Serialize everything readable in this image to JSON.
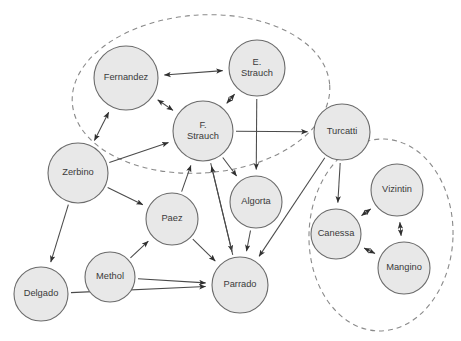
{
  "diagram": {
    "type": "directed-graph",
    "background_color": "#ffffff",
    "node_fill_color": "#e8e8e8",
    "node_stroke_color": "#6b6b6b",
    "edge_color": "#4a4a4a",
    "cluster_stroke_color": "#8a8a8a",
    "canvas": {
      "width": 461,
      "height": 341
    }
  },
  "nodes": [
    {
      "id": "fernandez",
      "label": "Fernandez",
      "lines": [
        "Fernandez"
      ],
      "cx": 126,
      "cy": 78,
      "r": 32
    },
    {
      "id": "e_strauch",
      "label": "E. Strauch",
      "lines": [
        "E.",
        "Strauch"
      ],
      "cx": 257,
      "cy": 68,
      "r": 28
    },
    {
      "id": "f_strauch",
      "label": "F. Strauch",
      "lines": [
        "F.",
        "Strauch"
      ],
      "cx": 203,
      "cy": 131,
      "r": 30
    },
    {
      "id": "turcatti",
      "label": "Turcatti",
      "lines": [
        "Turcatti"
      ],
      "cx": 342,
      "cy": 132,
      "r": 28
    },
    {
      "id": "zerbino",
      "label": "Zerbino",
      "lines": [
        "Zerbino"
      ],
      "cx": 78,
      "cy": 173,
      "r": 30
    },
    {
      "id": "algorta",
      "label": "Algorta",
      "lines": [
        "Algorta"
      ],
      "cx": 256,
      "cy": 202,
      "r": 26
    },
    {
      "id": "paez",
      "label": "Paez",
      "lines": [
        "Paez"
      ],
      "cx": 172,
      "cy": 219,
      "r": 26
    },
    {
      "id": "vizintin",
      "label": "Vizintin",
      "lines": [
        "Vizintin"
      ],
      "cx": 397,
      "cy": 190,
      "r": 26
    },
    {
      "id": "canessa",
      "label": "Canessa",
      "lines": [
        "Canessa"
      ],
      "cx": 336,
      "cy": 234,
      "r": 25
    },
    {
      "id": "mangino",
      "label": "Mangino",
      "lines": [
        "Mangino"
      ],
      "cx": 404,
      "cy": 268,
      "r": 26
    },
    {
      "id": "methol",
      "label": "Methol",
      "lines": [
        "Methol"
      ],
      "cx": 110,
      "cy": 277,
      "r": 25
    },
    {
      "id": "parrado",
      "label": "Parrado",
      "lines": [
        "Parrado"
      ],
      "cx": 240,
      "cy": 285,
      "r": 28
    },
    {
      "id": "delgado",
      "label": "Delgado",
      "lines": [
        "Delgado"
      ],
      "cx": 41,
      "cy": 294,
      "r": 27
    }
  ],
  "edges": [
    {
      "from": "fernandez",
      "to": "e_strauch",
      "arrows": "both"
    },
    {
      "from": "fernandez",
      "to": "f_strauch",
      "arrows": "both"
    },
    {
      "from": "e_strauch",
      "to": "f_strauch",
      "arrows": "both"
    },
    {
      "from": "e_strauch",
      "to": "algorta",
      "arrows": "forward"
    },
    {
      "from": "f_strauch",
      "to": "turcatti",
      "arrows": "forward"
    },
    {
      "from": "f_strauch",
      "to": "algorta",
      "arrows": "forward"
    },
    {
      "from": "f_strauch",
      "to": "parrado",
      "arrows": "forward"
    },
    {
      "from": "zerbino",
      "to": "fernandez",
      "arrows": "both"
    },
    {
      "from": "zerbino",
      "to": "f_strauch",
      "arrows": "forward"
    },
    {
      "from": "zerbino",
      "to": "paez",
      "arrows": "forward"
    },
    {
      "from": "zerbino",
      "to": "delgado",
      "arrows": "forward"
    },
    {
      "from": "paez",
      "to": "f_strauch",
      "arrows": "forward"
    },
    {
      "from": "paez",
      "to": "parrado",
      "arrows": "forward"
    },
    {
      "from": "parrado",
      "to": "f_strauch",
      "arrows": "forward"
    },
    {
      "from": "algorta",
      "to": "parrado",
      "arrows": "forward"
    },
    {
      "from": "turcatti",
      "to": "parrado",
      "arrows": "forward"
    },
    {
      "from": "turcatti",
      "to": "canessa",
      "arrows": "forward"
    },
    {
      "from": "methol",
      "to": "paez",
      "arrows": "forward"
    },
    {
      "from": "methol",
      "to": "parrado",
      "arrows": "forward"
    },
    {
      "from": "delgado",
      "to": "parrado",
      "arrows": "forward"
    },
    {
      "from": "canessa",
      "to": "vizintin",
      "arrows": "both"
    },
    {
      "from": "canessa",
      "to": "mangino",
      "arrows": "both"
    },
    {
      "from": "vizintin",
      "to": "mangino",
      "arrows": "both"
    }
  ],
  "clusters": [
    {
      "id": "cluster-left",
      "name": "left-dashed-cluster",
      "cx": 201,
      "cy": 94,
      "rx": 129,
      "ry": 79,
      "rotation": -4,
      "members": [
        "fernandez",
        "e_strauch",
        "f_strauch"
      ]
    },
    {
      "id": "cluster-right",
      "name": "right-dashed-cluster",
      "cx": 381,
      "cy": 235,
      "rx": 72,
      "ry": 96,
      "rotation": 2,
      "members": [
        "canessa",
        "vizintin",
        "mangino"
      ]
    }
  ]
}
